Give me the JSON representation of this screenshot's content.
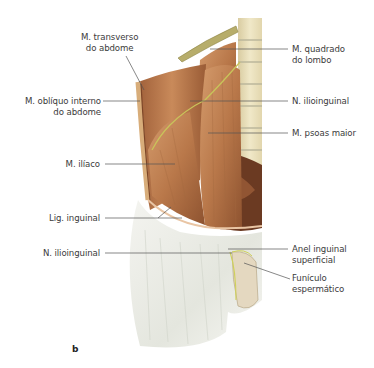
{
  "figure": {
    "panel_letter": "b",
    "colors": {
      "muscle": "#b9784a",
      "muscle_dark": "#8e5330",
      "muscle_light": "#d49b6c",
      "fascia": "#eeeeea",
      "fascia_shade": "#d9dbd3",
      "nerve": "#c9c45a",
      "bone": "#e9e0bf",
      "bone_shade": "#cfc39a",
      "leader_line": "#555555"
    },
    "labels": {
      "transverso": {
        "line1": "M. transverso",
        "line2": "do abdome"
      },
      "obliquo": {
        "line1": "M. oblíquo interno",
        "line2": "do abdome"
      },
      "iliaco": {
        "line1": "M. ilíaco"
      },
      "lig_inguinal": {
        "line1": "Lig. inguinal"
      },
      "n_ilioinguinal_left": {
        "line1": "N. ilioinguinal"
      },
      "quadrado": {
        "line1": "M. quadrado",
        "line2": "do lombo"
      },
      "n_ilioinguinal_right": {
        "line1": "N. ilioinguinal"
      },
      "psoas": {
        "line1": "M. psoas maior"
      },
      "anel": {
        "line1": "Anel inguinal",
        "line2": "superficial"
      },
      "funiculo": {
        "line1": "Funículo",
        "line2": "espermático"
      }
    }
  }
}
